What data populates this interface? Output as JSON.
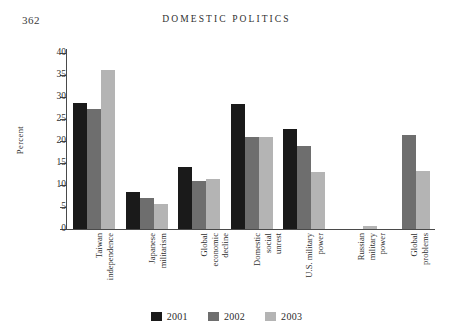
{
  "page": {
    "number": "362",
    "running_head": "DOMESTIC POLITICS"
  },
  "chart_data": {
    "type": "bar",
    "title": "",
    "xlabel": "",
    "ylabel": "Percent",
    "ylim": [
      0,
      40
    ],
    "yticks": [
      0,
      5,
      10,
      15,
      20,
      25,
      30,
      35,
      40
    ],
    "ytick_labels": [
      "0",
      "5",
      "10",
      "15",
      "20",
      "25",
      "30",
      "35",
      "40"
    ],
    "grid": false,
    "legend_position": "bottom-center",
    "categories": [
      "Taiwan independence",
      "Japanese militarism",
      "Global economic decline",
      "Domestic social unrest",
      "U.S. military power",
      "Russian military power",
      "Global problems"
    ],
    "category_lines": [
      [
        "Taiwan",
        "independence"
      ],
      [
        "Japanese",
        "militarism"
      ],
      [
        "Global",
        "economic",
        "decline"
      ],
      [
        "Domestic",
        "social",
        "unrest"
      ],
      [
        "U.S. military",
        "power"
      ],
      [
        "Russian",
        "military",
        "power"
      ],
      [
        "Global",
        "problems"
      ]
    ],
    "series": [
      {
        "name": "2001",
        "color": "#1a1a1a",
        "values": [
          28.6,
          8.5,
          14.0,
          28.5,
          22.8,
          0,
          0
        ]
      },
      {
        "name": "2002",
        "color": "#6e6e6e",
        "values": [
          27.3,
          7.0,
          11.0,
          21.0,
          18.8,
          0,
          21.3
        ]
      },
      {
        "name": "2003",
        "color": "#b4b4b4",
        "values": [
          36.2,
          5.6,
          11.4,
          21.0,
          13.0,
          0.7,
          13.2
        ]
      }
    ]
  },
  "legend": {
    "items": [
      {
        "label": "2001",
        "color": "#1a1a1a"
      },
      {
        "label": "2002",
        "color": "#6e6e6e"
      },
      {
        "label": "2003",
        "color": "#b4b4b4"
      }
    ]
  }
}
